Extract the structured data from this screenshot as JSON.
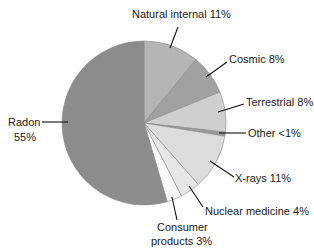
{
  "chart_data": {
    "type": "pie",
    "title": "",
    "start_angle_deg": 0,
    "direction": "clockwise",
    "slices": [
      {
        "label": "Natural internal",
        "value": 11,
        "display": "Natural internal 11%",
        "color": "#b4b4b4"
      },
      {
        "label": "Cosmic",
        "value": 8,
        "display": "Cosmic 8%",
        "color": "#a0a0a0"
      },
      {
        "label": "Terrestrial",
        "value": 8,
        "display": "Terrestrial 8%",
        "color": "#cfcfcf"
      },
      {
        "label": "Other",
        "value": 0.8,
        "display": "Other <1%",
        "color": "#9a9a9a"
      },
      {
        "label": "X-rays",
        "value": 11,
        "display": "X-rays 11%",
        "color": "#dcdcdc"
      },
      {
        "label": "Nuclear medicine",
        "value": 4,
        "display": "Nuclear medicine 4%",
        "color": "#e6e6e6"
      },
      {
        "label": "Consumer products",
        "value": 3,
        "display": "Consumer products 3%",
        "color": "#fafafa"
      },
      {
        "label": "Radon",
        "value": 55,
        "display": "Radon 55%",
        "color": "#8c8c8c"
      }
    ],
    "labels": {
      "natural_internal": "Natural internal 11%",
      "cosmic": "Cosmic 8%",
      "terrestrial": "Terrestrial 8%",
      "other": "Other <1%",
      "xrays": "X-rays 11%",
      "nuclear_medicine": "Nuclear medicine 4%",
      "consumer_line1": "Consumer",
      "consumer_line2": "products 3%",
      "radon_line1": "Radon",
      "radon_line2": "55%"
    },
    "legend": null
  }
}
